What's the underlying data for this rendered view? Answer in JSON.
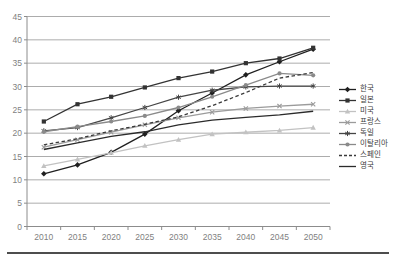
{
  "chart_data": {
    "type": "line",
    "title": "",
    "xlabel": "",
    "ylabel": "",
    "categories": [
      "2010",
      "2015",
      "2020",
      "2025",
      "2030",
      "2035",
      "2040",
      "2045",
      "2050"
    ],
    "ylim": [
      0,
      45
    ],
    "ytick_step": 5,
    "grid": "horizontal",
    "legend_position": "right",
    "series": [
      {
        "name": "한국",
        "values": [
          11.3,
          13.2,
          15.9,
          19.8,
          24.8,
          28.6,
          32.5,
          35.3,
          38.0
        ],
        "color": "#1f1f1f",
        "marker": "diamond",
        "line": "solid"
      },
      {
        "name": "일본",
        "values": [
          22.5,
          26.2,
          27.8,
          29.8,
          31.8,
          33.2,
          35.0,
          36.0,
          38.3
        ],
        "color": "#333333",
        "marker": "square",
        "line": "solid"
      },
      {
        "name": "미국",
        "values": [
          13.0,
          14.4,
          15.8,
          17.3,
          18.6,
          19.8,
          20.2,
          20.6,
          21.2
        ],
        "color": "#c2c2c2",
        "marker": "triangle",
        "line": "solid"
      },
      {
        "name": "프랑스",
        "values": [
          17.0,
          18.6,
          20.2,
          21.8,
          23.3,
          24.5,
          25.3,
          25.8,
          26.2
        ],
        "color": "#9b9b9b",
        "marker": "x",
        "line": "solid"
      },
      {
        "name": "독일",
        "values": [
          20.5,
          21.2,
          23.3,
          25.5,
          27.7,
          29.2,
          29.9,
          30.1,
          30.1
        ],
        "color": "#454545",
        "marker": "asterisk",
        "line": "solid"
      },
      {
        "name": "이탈리아",
        "values": [
          20.3,
          21.4,
          22.5,
          23.7,
          25.5,
          27.8,
          30.3,
          32.8,
          32.4
        ],
        "color": "#8a8a8a",
        "marker": "circle",
        "line": "solid"
      },
      {
        "name": "스페인",
        "values": [
          17.5,
          18.8,
          20.5,
          21.9,
          23.5,
          25.9,
          28.7,
          31.8,
          33.0
        ],
        "color": "#3a3a3a",
        "marker": "none",
        "line": "dashed"
      },
      {
        "name": "영국",
        "values": [
          16.5,
          17.9,
          19.3,
          20.3,
          21.8,
          22.8,
          23.4,
          23.9,
          24.7
        ],
        "color": "#2b2b2b",
        "marker": "none",
        "line": "solid"
      }
    ]
  },
  "axes": {
    "y_tick_labels": [
      "45",
      "40",
      "35",
      "30",
      "25",
      "20",
      "15",
      "10",
      "5",
      "0"
    ],
    "x_tick_labels": [
      "2010",
      "2015",
      "2020",
      "2025",
      "2030",
      "2035",
      "2040",
      "2045",
      "2050"
    ]
  },
  "colors": {
    "background": "#ffffff",
    "gridline": "#a3a3a3",
    "axis": "#8c8c8c",
    "tick_label": "#7f7f7f",
    "footer_rule": "#4d4d4d"
  }
}
